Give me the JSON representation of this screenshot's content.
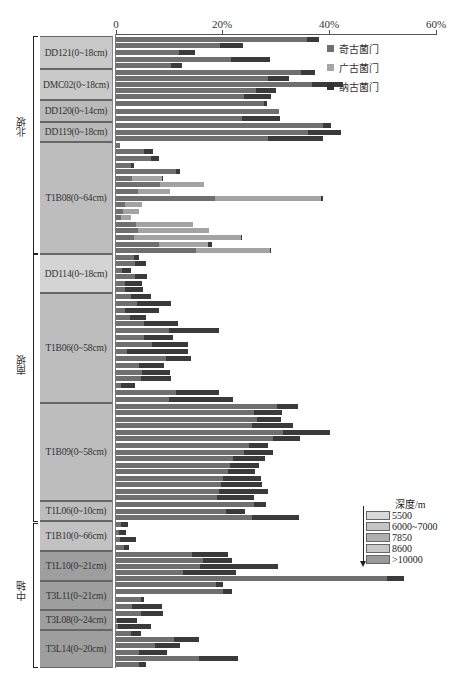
{
  "chart_data": {
    "type": "bar",
    "orientation": "horizontal",
    "stacked": true,
    "title": "",
    "xlabel": "",
    "ylabel": "",
    "xlim": [
      0,
      60
    ],
    "x_ticks": [
      "0",
      "20%",
      "40%",
      "60%"
    ],
    "grid": false,
    "legend_position": "upper right",
    "series_names": [
      "奇古菌门",
      "广古菌门",
      "纳古菌门"
    ],
    "series_colors": [
      "#6f6f6f",
      "#a3a3a3",
      "#3a3a3a"
    ],
    "regions": [
      {
        "name": "北坡",
        "groups": [
          "DD121(0~18cm)",
          "DMC02(0~18cm)",
          "DD120(0~14cm)",
          "DD119(0~18cm)",
          "T1B08(0~64cm)"
        ]
      },
      {
        "name": "南坡",
        "groups": [
          "DD114(0~18cm)",
          "T1B06(0~58cm)",
          "T1B09(0~58cm)",
          "T1L06(0~10cm)"
        ]
      },
      {
        "name": "中轴",
        "groups": [
          "T1B10(0~66cm)",
          "T1L10(0~21cm)",
          "T3L11(0~21cm)",
          "T3L08(0~24cm)",
          "T3L14(0~20cm)"
        ]
      }
    ],
    "depth_legend": {
      "title": "深度/m",
      "levels": [
        {
          "label": "5500",
          "color": "#d9d9d9"
        },
        {
          "label": "6000~7000",
          "color": "#c4c4c4"
        },
        {
          "label": "7850",
          "color": "#b0b0b0"
        },
        {
          "label": "8600",
          "color": "#c8c8c8"
        },
        {
          "label": ">10000",
          "color": "#9a9a9a"
        }
      ]
    },
    "groups": [
      {
        "label": "DD121(0~18cm)",
        "depth_level": "6000~7000",
        "y0": 36,
        "y1": 69,
        "color": "#c9c9c9",
        "bars": [
          [
            35.8,
            0,
            2.3
          ],
          [
            19.6,
            0,
            4.3
          ],
          [
            11.8,
            0,
            3.0
          ],
          [
            21.5,
            0,
            7.4
          ],
          [
            10.3,
            0,
            2.0
          ]
        ]
      },
      {
        "label": "DMC02(0~18cm)",
        "depth_level": "6000~7000",
        "y0": 69,
        "y1": 100,
        "color": "#c9c9c9",
        "bars": [
          [
            34.8,
            0,
            2.6
          ],
          [
            28.6,
            0,
            3.9
          ],
          [
            36.7,
            0,
            5.9
          ],
          [
            26.3,
            0,
            3.8
          ],
          [
            24.1,
            0,
            5.0
          ]
        ]
      },
      {
        "label": "DD120(0~14cm)",
        "depth_level": "7850",
        "y0": 100,
        "y1": 122,
        "color": "#b9b9b9",
        "bars": [
          [
            27.8,
            0,
            0.5
          ],
          [
            30.6,
            0,
            0
          ],
          [
            23.6,
            0,
            7.2
          ]
        ]
      },
      {
        "label": "DD119(0~18cm)",
        "depth_level": "7850",
        "y0": 122,
        "y1": 142,
        "color": "#b9b9b9",
        "bars": [
          [
            38.9,
            0,
            1.5
          ],
          [
            36.0,
            0,
            6.2
          ],
          [
            28.6,
            0,
            10.2
          ]
        ]
      },
      {
        "label": "T1B08(0~64cm)",
        "depth_level": "6000~7000",
        "y0": 142,
        "y1": 254,
        "color": "#bdbdbd",
        "bars": [
          [
            0.8,
            0,
            0
          ],
          [
            5.2,
            0,
            1.7
          ],
          [
            6.6,
            0,
            1.5
          ],
          [
            2.8,
            0,
            0.5
          ],
          [
            11.2,
            0,
            0.8
          ],
          [
            3.0,
            5.6,
            0.3
          ],
          [
            8.3,
            8.3,
            0
          ],
          [
            4.1,
            6.1,
            0
          ],
          [
            18.6,
            19.8,
            0.4
          ],
          [
            1.7,
            3.2,
            0
          ],
          [
            1.3,
            3.0,
            0
          ],
          [
            1.0,
            1.9,
            0
          ],
          [
            3.7,
            10.7,
            0
          ],
          [
            4.2,
            13.2,
            0
          ],
          [
            3.3,
            20.1,
            0.3
          ],
          [
            8.1,
            9.1,
            0.8
          ],
          [
            15.1,
            13.8,
            0.2
          ]
        ]
      },
      {
        "label": "DD114(0~18cm)",
        "depth_level": "5500",
        "y0": 254,
        "y1": 293,
        "color": "#d4d4d4",
        "bars": [
          [
            3.3,
            0,
            1.1
          ],
          [
            3.5,
            0,
            2.2
          ],
          [
            1.1,
            0,
            1.8
          ],
          [
            3.5,
            0,
            2.3
          ],
          [
            1.6,
            0,
            3.2
          ],
          [
            1.7,
            0,
            3.3
          ]
        ]
      },
      {
        "label": "T1B06(0~58cm)",
        "depth_level": "6000~7000",
        "y0": 293,
        "y1": 403,
        "color": "#bdbdbd",
        "bars": [
          [
            2.9,
            0,
            3.6
          ],
          [
            3.9,
            0,
            6.4
          ],
          [
            1.6,
            0,
            6.4
          ],
          [
            2.6,
            0,
            3.1
          ],
          [
            5.3,
            0,
            6.4
          ],
          [
            10.0,
            0,
            9.3
          ],
          [
            5.2,
            0,
            5.5
          ],
          [
            6.8,
            0,
            6.7
          ],
          [
            2.0,
            0,
            11.6
          ],
          [
            9.4,
            0,
            4.7
          ],
          [
            4.3,
            0,
            4.8
          ],
          [
            4.8,
            0,
            5.4
          ],
          [
            4.7,
            0,
            5.6
          ],
          [
            0.9,
            0,
            2.7
          ],
          [
            11.3,
            0,
            8.0
          ],
          [
            10.0,
            0,
            12.0
          ]
        ]
      },
      {
        "label": "T1B09(0~58cm)",
        "depth_level": "8600",
        "y0": 403,
        "y1": 501,
        "color": "#bdbdbd",
        "bars": [
          [
            30.3,
            0,
            3.9
          ],
          [
            25.9,
            0,
            5.3
          ],
          [
            26.4,
            0,
            4.6
          ],
          [
            25.5,
            0,
            7.8
          ],
          [
            31.3,
            0,
            8.9
          ],
          [
            29.5,
            0,
            5.0
          ],
          [
            25.0,
            0,
            3.6
          ],
          [
            24.1,
            0,
            5.3
          ],
          [
            22.0,
            0,
            6.0
          ],
          [
            21.3,
            0,
            5.5
          ],
          [
            21.1,
            0,
            5.0
          ],
          [
            20.1,
            0,
            7.1
          ],
          [
            19.7,
            0,
            7.6
          ],
          [
            19.4,
            0,
            9.1
          ],
          [
            18.9,
            0,
            6.9
          ]
        ]
      },
      {
        "label": "T1L06(0~10cm)",
        "depth_level": "8600",
        "y0": 501,
        "y1": 521,
        "color": "#bdbdbd",
        "bars": [
          [
            25.9,
            0,
            2.3
          ],
          [
            20.7,
            0,
            3.5
          ],
          [
            25.6,
            0,
            8.8
          ]
        ]
      },
      {
        "label": "T1B10(0~66cm)",
        "depth_level": ">10000",
        "y0": 521,
        "y1": 551,
        "color": "#c2c2c2",
        "bars": [
          [
            1.0,
            0,
            1.2
          ],
          [
            0.6,
            0,
            1.3
          ],
          [
            0.7,
            0,
            3.0
          ],
          [
            1.5,
            0,
            0.9
          ]
        ]
      },
      {
        "label": "T1L10(0~21cm)",
        "depth_level": ">10000",
        "y0": 551,
        "y1": 581,
        "color": "#9e9e9e",
        "bars": [
          [
            14.3,
            0,
            6.7
          ],
          [
            16.4,
            0,
            5.4
          ],
          [
            15.8,
            0,
            14.6
          ],
          [
            12.6,
            0,
            10.0
          ],
          [
            50.9,
            0,
            3.1
          ]
        ]
      },
      {
        "label": "T3L11(0~21cm)",
        "depth_level": ">10000",
        "y0": 581,
        "y1": 610,
        "color": "#9e9e9e",
        "bars": [
          [
            18.7,
            0,
            1.4
          ],
          [
            20.0,
            0,
            1.8
          ],
          [
            4.6,
            0,
            0.7
          ],
          [
            3.0,
            0,
            5.7
          ]
        ]
      },
      {
        "label": "T3L08(0~24cm)",
        "depth_level": ">10000",
        "y0": 610,
        "y1": 630,
        "color": "#9e9e9e",
        "bars": [
          [
            4.6,
            0,
            4.3
          ],
          [
            0.2,
            0,
            3.7
          ],
          [
            0.4,
            0,
            6.2
          ]
        ]
      },
      {
        "label": "T3L14(0~20cm)",
        "depth_level": ">10000",
        "y0": 630,
        "y1": 668,
        "color": "#9e9e9e",
        "bars": [
          [
            2.8,
            0,
            1.9
          ],
          [
            10.9,
            0,
            4.7
          ],
          [
            7.3,
            0,
            4.8
          ],
          [
            4.4,
            0,
            5.2
          ],
          [
            15.6,
            0,
            7.2
          ],
          [
            4.4,
            0,
            1.3
          ]
        ]
      }
    ]
  },
  "legend": {
    "items": [
      {
        "label": "奇古菌门",
        "color": "#707070"
      },
      {
        "label": "广古菌门",
        "color": "#a6a6a6"
      },
      {
        "label": "纳古菌门",
        "color": "#333333"
      }
    ]
  },
  "depth_legend": {
    "title": "深度/m",
    "items": [
      "5500",
      "6000~7000",
      "7850",
      "8600",
      ">10000"
    ]
  },
  "regions": {
    "north": "北坡",
    "south": "南坡",
    "center": "中轴"
  },
  "axis": {
    "ticks": [
      "0",
      "20%",
      "40%",
      "60%"
    ]
  }
}
